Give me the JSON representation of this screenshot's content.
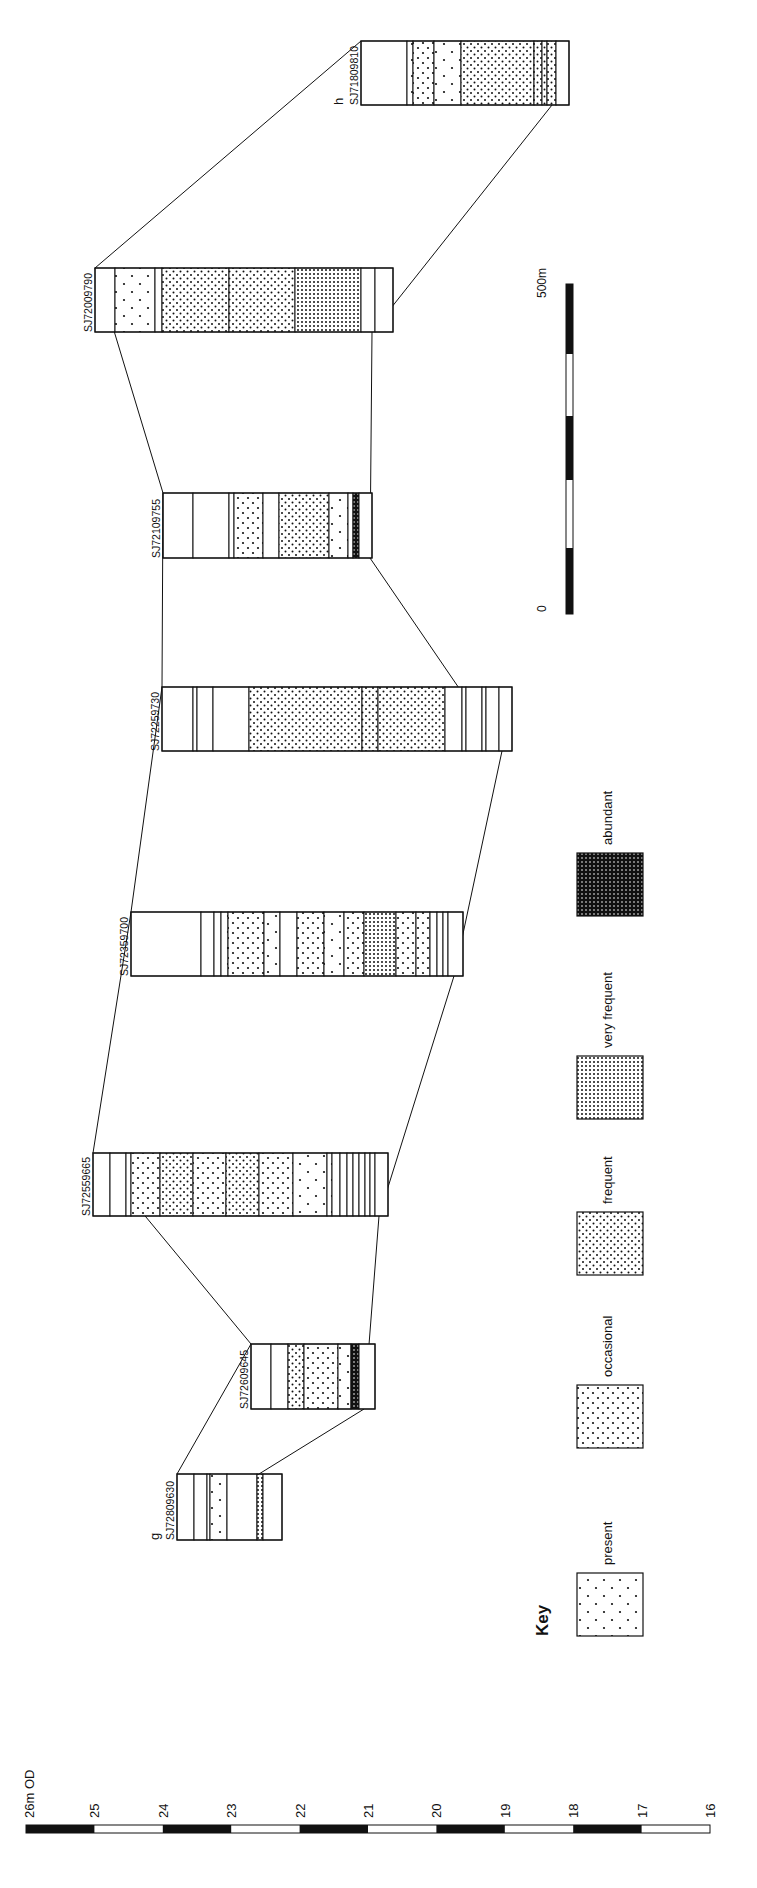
{
  "diagram": {
    "orientation": "rotated-90-ccw",
    "section_ends": {
      "start": "g",
      "end": "h"
    },
    "colors": {
      "ink": "#111111",
      "paper": "#ffffff"
    }
  },
  "key": {
    "title": "Key",
    "items": [
      {
        "id": "present",
        "label": "present",
        "pattern": "present"
      },
      {
        "id": "occasional",
        "label": "occasional",
        "pattern": "occasional"
      },
      {
        "id": "frequent",
        "label": "frequent",
        "pattern": "frequent"
      },
      {
        "id": "very_frequent",
        "label": "very frequent",
        "pattern": "very_frequent"
      },
      {
        "id": "abundant",
        "label": "abundant",
        "pattern": "abundant"
      }
    ]
  },
  "horizontal_scale": {
    "start_label": "0",
    "end_label": "500m",
    "segments": 5
  },
  "vertical_scale": {
    "unit_label": "26m OD",
    "ticks": [
      "25",
      "24",
      "23",
      "22",
      "21",
      "20",
      "19",
      "18",
      "17",
      "16"
    ],
    "segments": 10
  },
  "cores": [
    {
      "id": "SJ72809630",
      "end_label": "g",
      "rect": {
        "x": 177,
        "y": 1474,
        "w": 105,
        "h": 66
      },
      "bands": [
        {
          "from": 0,
          "to": 17,
          "fill": "blank"
        },
        {
          "from": 17,
          "to": 30,
          "fill": "blank"
        },
        {
          "from": 30,
          "to": 33,
          "fill": "blank"
        },
        {
          "from": 33,
          "to": 50,
          "fill": "present"
        },
        {
          "from": 50,
          "to": 80,
          "fill": "blank"
        },
        {
          "from": 80,
          "to": 86,
          "fill": "very_frequent"
        },
        {
          "from": 86,
          "to": 105,
          "fill": "blank"
        }
      ]
    },
    {
      "id": "SJ72609645",
      "rect": {
        "x": 251,
        "y": 1344,
        "w": 124,
        "h": 65
      },
      "bands": [
        {
          "from": 0,
          "to": 20,
          "fill": "blank"
        },
        {
          "from": 20,
          "to": 37,
          "fill": "blank"
        },
        {
          "from": 37,
          "to": 53,
          "fill": "frequent"
        },
        {
          "from": 53,
          "to": 87,
          "fill": "occasional"
        },
        {
          "from": 87,
          "to": 100,
          "fill": "present"
        },
        {
          "from": 100,
          "to": 108,
          "fill": "abundant"
        },
        {
          "from": 108,
          "to": 124,
          "fill": "blank"
        }
      ]
    },
    {
      "id": "SJ72559665",
      "rect": {
        "x": 93,
        "y": 1153,
        "w": 295,
        "h": 63
      },
      "bands": [
        {
          "from": 0,
          "to": 17,
          "fill": "blank"
        },
        {
          "from": 17,
          "to": 33,
          "fill": "blank"
        },
        {
          "from": 33,
          "to": 38,
          "fill": "blank"
        },
        {
          "from": 38,
          "to": 67,
          "fill": "occasional"
        },
        {
          "from": 67,
          "to": 100,
          "fill": "frequent"
        },
        {
          "from": 100,
          "to": 133,
          "fill": "occasional"
        },
        {
          "from": 133,
          "to": 166,
          "fill": "frequent"
        },
        {
          "from": 166,
          "to": 200,
          "fill": "occasional"
        },
        {
          "from": 200,
          "to": 234,
          "fill": "present"
        },
        {
          "from": 234,
          "to": 239,
          "fill": "present"
        },
        {
          "from": 239,
          "to": 247,
          "fill": "blank"
        },
        {
          "from": 247,
          "to": 254,
          "fill": "blank"
        },
        {
          "from": 254,
          "to": 260,
          "fill": "blank"
        },
        {
          "from": 260,
          "to": 266,
          "fill": "blank"
        },
        {
          "from": 266,
          "to": 272,
          "fill": "blank"
        },
        {
          "from": 272,
          "to": 277,
          "fill": "blank"
        },
        {
          "from": 277,
          "to": 282,
          "fill": "blank"
        },
        {
          "from": 282,
          "to": 295,
          "fill": "blank"
        }
      ]
    },
    {
      "id": "SJ72359700",
      "rect": {
        "x": 131,
        "y": 912,
        "w": 332,
        "h": 64
      },
      "bands": [
        {
          "from": 0,
          "to": 70,
          "fill": "blank"
        },
        {
          "from": 70,
          "to": 83,
          "fill": "blank"
        },
        {
          "from": 83,
          "to": 90,
          "fill": "blank"
        },
        {
          "from": 90,
          "to": 97,
          "fill": "present"
        },
        {
          "from": 97,
          "to": 133,
          "fill": "occasional"
        },
        {
          "from": 133,
          "to": 149,
          "fill": "present"
        },
        {
          "from": 149,
          "to": 166,
          "fill": "blank"
        },
        {
          "from": 166,
          "to": 193,
          "fill": "occasional"
        },
        {
          "from": 193,
          "to": 213,
          "fill": "present"
        },
        {
          "from": 213,
          "to": 233,
          "fill": "occasional"
        },
        {
          "from": 233,
          "to": 265,
          "fill": "very_frequent"
        },
        {
          "from": 265,
          "to": 285,
          "fill": "occasional"
        },
        {
          "from": 285,
          "to": 299,
          "fill": "occasional"
        },
        {
          "from": 299,
          "to": 306,
          "fill": "blank"
        },
        {
          "from": 306,
          "to": 312,
          "fill": "present"
        },
        {
          "from": 312,
          "to": 317,
          "fill": "blank"
        },
        {
          "from": 317,
          "to": 332,
          "fill": "blank"
        }
      ]
    },
    {
      "id": "SJ72259730",
      "rect": {
        "x": 162,
        "y": 687,
        "w": 350,
        "h": 64
      },
      "bands": [
        {
          "from": 0,
          "to": 31,
          "fill": "blank"
        },
        {
          "from": 31,
          "to": 35,
          "fill": "blank"
        },
        {
          "from": 35,
          "to": 51,
          "fill": "blank"
        },
        {
          "from": 51,
          "to": 87,
          "fill": "blank"
        },
        {
          "from": 87,
          "to": 200,
          "fill": "frequent"
        },
        {
          "from": 200,
          "to": 216,
          "fill": "frequent"
        },
        {
          "from": 216,
          "to": 283,
          "fill": "frequent"
        },
        {
          "from": 283,
          "to": 300,
          "fill": "blank"
        },
        {
          "from": 300,
          "to": 304,
          "fill": "blank"
        },
        {
          "from": 304,
          "to": 320,
          "fill": "blank"
        },
        {
          "from": 320,
          "to": 324,
          "fill": "blank"
        },
        {
          "from": 324,
          "to": 337,
          "fill": "blank"
        },
        {
          "from": 337,
          "to": 350,
          "fill": "blank"
        }
      ]
    },
    {
      "id": "SJ72109755",
      "rect": {
        "x": 163,
        "y": 493,
        "w": 209,
        "h": 65
      },
      "bands": [
        {
          "from": 0,
          "to": 30,
          "fill": "blank"
        },
        {
          "from": 30,
          "to": 66,
          "fill": "blank"
        },
        {
          "from": 66,
          "to": 71,
          "fill": "blank"
        },
        {
          "from": 71,
          "to": 100,
          "fill": "occasional"
        },
        {
          "from": 100,
          "to": 116,
          "fill": "blank"
        },
        {
          "from": 116,
          "to": 166,
          "fill": "frequent"
        },
        {
          "from": 166,
          "to": 185,
          "fill": "present"
        },
        {
          "from": 185,
          "to": 190,
          "fill": "blank"
        },
        {
          "from": 190,
          "to": 196,
          "fill": "abundant"
        },
        {
          "from": 196,
          "to": 209,
          "fill": "blank"
        }
      ]
    },
    {
      "id": "SJ72009790",
      "rect": {
        "x": 95,
        "y": 268,
        "w": 298,
        "h": 64
      },
      "bands": [
        {
          "from": 0,
          "to": 20,
          "fill": "blank"
        },
        {
          "from": 20,
          "to": 60,
          "fill": "present"
        },
        {
          "from": 60,
          "to": 67,
          "fill": "blank"
        },
        {
          "from": 67,
          "to": 134,
          "fill": "frequent"
        },
        {
          "from": 134,
          "to": 200,
          "fill": "frequent"
        },
        {
          "from": 200,
          "to": 266,
          "fill": "very_frequent"
        },
        {
          "from": 266,
          "to": 280,
          "fill": "blank"
        },
        {
          "from": 280,
          "to": 298,
          "fill": "blank"
        }
      ]
    },
    {
      "id": "SJ71809810",
      "end_label": "h",
      "rect": {
        "x": 361,
        "y": 41,
        "w": 208,
        "h": 64
      },
      "bands": [
        {
          "from": 0,
          "to": 46,
          "fill": "blank"
        },
        {
          "from": 46,
          "to": 52,
          "fill": "present"
        },
        {
          "from": 52,
          "to": 73,
          "fill": "occasional"
        },
        {
          "from": 73,
          "to": 100,
          "fill": "present"
        },
        {
          "from": 100,
          "to": 173,
          "fill": "frequent"
        },
        {
          "from": 173,
          "to": 181,
          "fill": "frequent"
        },
        {
          "from": 181,
          "to": 186,
          "fill": "frequent"
        },
        {
          "from": 186,
          "to": 195,
          "fill": "frequent"
        },
        {
          "from": 195,
          "to": 208,
          "fill": "blank"
        }
      ]
    }
  ]
}
